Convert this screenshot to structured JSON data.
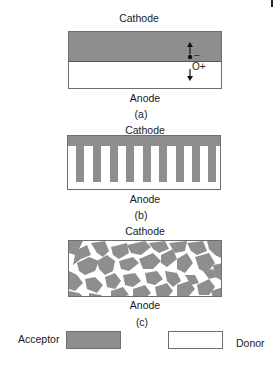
{
  "colors": {
    "acceptor": "#8e8e8e",
    "donor": "#ffffff",
    "border": "#6e6e6e",
    "text": "#1a1a1a"
  },
  "panels": [
    {
      "id": "a",
      "caption": "(a)",
      "top_label": "Cathode",
      "bottom_label": "Anode",
      "structure": "bilayer",
      "annotations": {
        "electron_symbol": "−",
        "hole_label": "O+"
      }
    },
    {
      "id": "b",
      "caption": "(b)",
      "top_label": "Cathode",
      "bottom_label": "Anode",
      "structure": "interdigitated",
      "finger_count": 9
    },
    {
      "id": "c",
      "caption": "(c)",
      "top_label": "Cathode",
      "bottom_label": "Anode",
      "structure": "bulk-heterojunction"
    }
  ],
  "legend": {
    "acceptor_label": "Acceptor",
    "donor_label": "Donor"
  }
}
